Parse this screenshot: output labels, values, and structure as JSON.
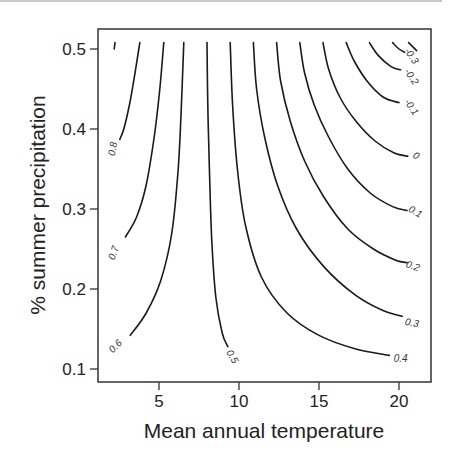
{
  "chart_data": {
    "type": "contour",
    "title": "",
    "xlabel": "Mean annual temperature",
    "ylabel": "% summer precipitation",
    "xlim": [
      1.5,
      22.3
    ],
    "ylim": [
      0.083,
      0.524
    ],
    "xticks": [
      5,
      10,
      15,
      20
    ],
    "xtick_labels": [
      "5",
      "10",
      "15",
      "20"
    ],
    "yticks": [
      0.1,
      0.2,
      0.3,
      0.4,
      0.5
    ],
    "ytick_labels": [
      "0.1",
      "0.2",
      "0.3",
      "0.4",
      "0.5"
    ],
    "grid": false,
    "legend": null,
    "contours": [
      {
        "level": 0.9,
        "label": "",
        "points": [
          [
            2.25,
            0.508
          ],
          [
            2.2,
            0.5
          ]
        ]
      },
      {
        "level": 0.8,
        "label": "0.8",
        "label_at": [
          2.15,
          0.375
        ],
        "label_rot": -80,
        "points": [
          [
            3.8,
            0.508
          ],
          [
            3.5,
            0.47
          ],
          [
            3.15,
            0.43
          ],
          [
            2.8,
            0.4
          ],
          [
            2.55,
            0.387
          ]
        ]
      },
      {
        "level": 0.7,
        "label": "0.7",
        "label_at": [
          2.2,
          0.245
        ],
        "label_rot": -72,
        "points": [
          [
            5.3,
            0.508
          ],
          [
            5.05,
            0.45
          ],
          [
            4.7,
            0.39
          ],
          [
            4.2,
            0.33
          ],
          [
            3.6,
            0.29
          ],
          [
            2.9,
            0.265
          ]
        ]
      },
      {
        "level": 0.6,
        "label": "0.6",
        "label_at": [
          2.3,
          0.128
        ],
        "label_rot": -45,
        "points": [
          [
            6.55,
            0.508
          ],
          [
            6.4,
            0.43
          ],
          [
            6.2,
            0.35
          ],
          [
            5.8,
            0.27
          ],
          [
            5.1,
            0.21
          ],
          [
            4.2,
            0.17
          ],
          [
            3.2,
            0.142
          ]
        ]
      },
      {
        "level": 0.5,
        "label": "0.5",
        "label_at": [
          9.55,
          0.115
        ],
        "label_rot": 60,
        "points": [
          [
            8.0,
            0.508
          ],
          [
            8.05,
            0.43
          ],
          [
            8.15,
            0.35
          ],
          [
            8.3,
            0.26
          ],
          [
            8.55,
            0.19
          ],
          [
            8.95,
            0.145
          ],
          [
            9.3,
            0.128
          ]
        ]
      },
      {
        "level": 0.4,
        "label": "0.4",
        "label_at": [
          20.1,
          0.112
        ],
        "label_rot": 0,
        "points": [
          [
            9.45,
            0.508
          ],
          [
            9.6,
            0.43
          ],
          [
            9.9,
            0.35
          ],
          [
            10.4,
            0.28
          ],
          [
            11.4,
            0.215
          ],
          [
            13.0,
            0.17
          ],
          [
            15.0,
            0.142
          ],
          [
            17.3,
            0.125
          ],
          [
            19.4,
            0.117
          ]
        ]
      },
      {
        "level": 0.3,
        "label": "0.3",
        "label_at": [
          20.8,
          0.157
        ],
        "label_rot": 10,
        "points": [
          [
            10.9,
            0.508
          ],
          [
            11.1,
            0.45
          ],
          [
            11.6,
            0.39
          ],
          [
            12.4,
            0.33
          ],
          [
            13.6,
            0.275
          ],
          [
            15.3,
            0.228
          ],
          [
            17.3,
            0.192
          ],
          [
            19.0,
            0.173
          ],
          [
            20.2,
            0.166
          ]
        ]
      },
      {
        "level": 0.2,
        "label": "0.2",
        "label_at": [
          20.85,
          0.228
        ],
        "label_rot": 20,
        "points": [
          [
            12.35,
            0.508
          ],
          [
            12.6,
            0.46
          ],
          [
            13.2,
            0.41
          ],
          [
            14.1,
            0.36
          ],
          [
            15.3,
            0.315
          ],
          [
            16.8,
            0.275
          ],
          [
            18.4,
            0.25
          ],
          [
            19.8,
            0.236
          ],
          [
            20.5,
            0.233
          ]
        ]
      },
      {
        "level": 0.1,
        "label": "0.1",
        "label_at": [
          21.0,
          0.296
        ],
        "label_rot": 30,
        "points": [
          [
            13.8,
            0.508
          ],
          [
            14.1,
            0.47
          ],
          [
            14.7,
            0.43
          ],
          [
            15.6,
            0.39
          ],
          [
            16.8,
            0.35
          ],
          [
            18.2,
            0.32
          ],
          [
            19.6,
            0.303
          ],
          [
            20.5,
            0.298
          ]
        ]
      },
      {
        "level": 0.0,
        "label": "0",
        "label_at": [
          21.05,
          0.366
        ],
        "label_rot": 35,
        "points": [
          [
            15.25,
            0.508
          ],
          [
            15.6,
            0.475
          ],
          [
            16.3,
            0.44
          ],
          [
            17.3,
            0.41
          ],
          [
            18.5,
            0.385
          ],
          [
            19.7,
            0.37
          ],
          [
            20.55,
            0.366
          ]
        ]
      },
      {
        "level": -0.1,
        "label": "-0.1",
        "label_at": [
          20.75,
          0.427
        ],
        "label_rot": 55,
        "points": [
          [
            16.7,
            0.508
          ],
          [
            17.2,
            0.485
          ],
          [
            18.0,
            0.46
          ],
          [
            19.0,
            0.44
          ],
          [
            20.0,
            0.433
          ]
        ]
      },
      {
        "level": -0.2,
        "label": "-0.2",
        "label_at": [
          20.75,
          0.465
        ],
        "label_rot": 55,
        "points": [
          [
            18.15,
            0.508
          ],
          [
            18.7,
            0.492
          ],
          [
            19.5,
            0.478
          ],
          [
            20.1,
            0.474
          ]
        ]
      },
      {
        "level": -0.3,
        "label": "-0.3",
        "label_at": [
          20.75,
          0.491
        ],
        "label_rot": 55,
        "points": [
          [
            19.6,
            0.508
          ],
          [
            20.0,
            0.5
          ],
          [
            20.35,
            0.496
          ]
        ]
      },
      {
        "level": -0.4,
        "label": "",
        "points": [
          [
            20.6,
            0.508
          ],
          [
            21.1,
            0.498
          ]
        ]
      }
    ]
  }
}
